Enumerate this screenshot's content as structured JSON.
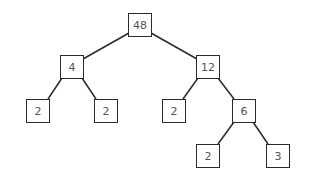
{
  "diagram": {
    "type": "factor-tree",
    "colors": {
      "stroke": "#2a2a2a",
      "text": "#555555",
      "background": "#ffffff"
    },
    "nodes": [
      {
        "id": "n48",
        "label": "48",
        "x": 128,
        "y": 13
      },
      {
        "id": "n4",
        "label": "4",
        "x": 60,
        "y": 55
      },
      {
        "id": "n12",
        "label": "12",
        "x": 196,
        "y": 55
      },
      {
        "id": "n2a",
        "label": "2",
        "x": 26,
        "y": 99
      },
      {
        "id": "n2b",
        "label": "2",
        "x": 94,
        "y": 99
      },
      {
        "id": "n2c",
        "label": "2",
        "x": 162,
        "y": 99
      },
      {
        "id": "n6",
        "label": "6",
        "x": 232,
        "y": 99
      },
      {
        "id": "n2d",
        "label": "2",
        "x": 196,
        "y": 144
      },
      {
        "id": "n3",
        "label": "3",
        "x": 266,
        "y": 144
      }
    ],
    "edges": [
      [
        "n48",
        "n4"
      ],
      [
        "n48",
        "n12"
      ],
      [
        "n4",
        "n2a"
      ],
      [
        "n4",
        "n2b"
      ],
      [
        "n12",
        "n2c"
      ],
      [
        "n12",
        "n6"
      ],
      [
        "n6",
        "n2d"
      ],
      [
        "n6",
        "n3"
      ]
    ]
  }
}
